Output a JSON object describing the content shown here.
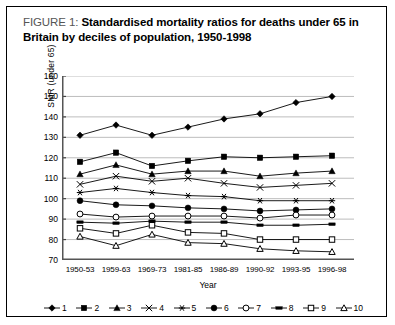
{
  "figure": {
    "label": "FIGURE 1:",
    "title": "Standardised mortality ratios for deaths under 65 in Britain by deciles of population, 1950-1998",
    "border_color": "#000000",
    "background": "#ffffff"
  },
  "chart_data": {
    "type": "line",
    "title": "Standardised mortality ratios for deaths under 65 in Britain by deciles of population, 1950-1998",
    "xlabel": "Year",
    "ylabel": "SMR (under 65)",
    "ylim": [
      70,
      160
    ],
    "yticks": [
      70,
      80,
      90,
      100,
      110,
      120,
      130,
      140,
      150,
      160
    ],
    "grid": true,
    "legend_position": "bottom",
    "categories": [
      "1950-53",
      "1959-63",
      "1969-73",
      "1981-85",
      "1986-89",
      "1990-92",
      "1993-95",
      "1996-98"
    ],
    "series": [
      {
        "name": "1",
        "marker": "filled-diamond",
        "color": "#000000",
        "values": [
          131,
          136,
          131,
          135,
          139,
          141.5,
          147,
          150
        ]
      },
      {
        "name": "2",
        "marker": "filled-square",
        "color": "#000000",
        "values": [
          118,
          122.5,
          116,
          118.5,
          120.5,
          120,
          120.5,
          121
        ]
      },
      {
        "name": "3",
        "marker": "filled-triangle",
        "color": "#000000",
        "values": [
          112,
          116.5,
          112,
          113.5,
          113.5,
          111,
          112.5,
          113.5
        ]
      },
      {
        "name": "4",
        "marker": "cross-x",
        "color": "#000000",
        "values": [
          107,
          111,
          108.5,
          110,
          107.5,
          105.5,
          106.5,
          107.5
        ]
      },
      {
        "name": "5",
        "marker": "asterisk",
        "color": "#000000",
        "values": [
          103,
          105,
          103,
          101.5,
          101,
          99,
          99,
          99
        ]
      },
      {
        "name": "6",
        "marker": "filled-circle",
        "color": "#000000",
        "values": [
          99,
          97,
          96.5,
          95.5,
          95,
          94,
          94.5,
          95
        ]
      },
      {
        "name": "7",
        "marker": "open-circle",
        "color": "#000000",
        "values": [
          92.5,
          91,
          91.5,
          91.5,
          91.5,
          90.5,
          92,
          92
        ]
      },
      {
        "name": "8",
        "marker": "dash",
        "color": "#000000",
        "values": [
          88.5,
          88,
          89,
          88.5,
          88.5,
          87,
          87,
          87.5
        ]
      },
      {
        "name": "9",
        "marker": "open-square",
        "color": "#000000",
        "values": [
          85.5,
          83,
          87,
          83.5,
          83,
          80,
          80,
          80
        ]
      },
      {
        "name": "10",
        "marker": "open-triangle",
        "color": "#000000",
        "values": [
          81.5,
          77,
          82.5,
          78.5,
          78,
          75.5,
          74.5,
          74
        ]
      }
    ]
  }
}
